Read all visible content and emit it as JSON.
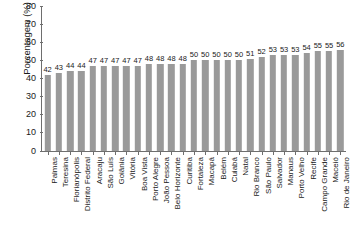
{
  "chart_data": {
    "type": "bar",
    "title": "",
    "xlabel": "",
    "ylabel": "Porcentagem (%)",
    "ylim": [
      0,
      80
    ],
    "yticks": [
      0,
      10,
      20,
      30,
      40,
      50,
      60,
      70,
      80
    ],
    "grid": false,
    "legend": null,
    "orientation": "vertical",
    "bar_color": "#9a9a9a",
    "categories": [
      "Palmas",
      "Teresina",
      "Florianópolis",
      "Distrito Federal",
      "Aracaju",
      "São Luís",
      "Goiânia",
      "Vitória",
      "Boa Vista",
      "Porto Alegre",
      "João Pessoa",
      "Belo Horizonte",
      "Curitiba",
      "Fortaleza",
      "Macapá",
      "Belém",
      "Cuiabá",
      "Natal",
      "Rio Branco",
      "São Paulo",
      "Salvador",
      "Manaus",
      "Porto Velho",
      "Recife",
      "Campo Grande",
      "Maceió",
      "Rio de Janeiro"
    ],
    "values": [
      42,
      43,
      44,
      44,
      47,
      47,
      47,
      47,
      47,
      48,
      48,
      48,
      48,
      50,
      50,
      50,
      50,
      50,
      51,
      52,
      53,
      53,
      53,
      54,
      55,
      55,
      56
    ]
  }
}
